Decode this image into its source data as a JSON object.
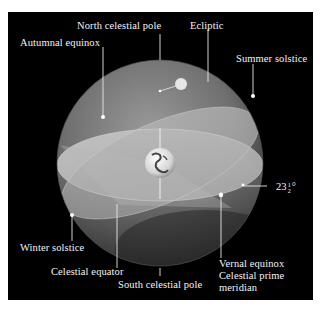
{
  "diagram": {
    "background_color": "#000000",
    "labels": {
      "north_celestial_pole": "North celestial pole",
      "ecliptic": "Ecliptic",
      "autumnal_equinox": "Autumnal equinox",
      "summer_solstice": "Summer solstice",
      "tilt_angle_whole": "23",
      "tilt_angle_num": "1",
      "tilt_angle_den": "2",
      "tilt_angle_unit": "°",
      "winter_solstice": "Winter solstice",
      "celestial_equator": "Celestial equator",
      "south_celestial_pole": "South celestial pole",
      "vernal_equinox": "Vernal equinox",
      "celestial_prime_meridian_line1": "Celestial prime",
      "celestial_prime_meridian_line2": "meridian"
    },
    "elements": {
      "sphere": "celestial-sphere",
      "earth": "earth-globe",
      "sun": "sun-marker"
    }
  }
}
